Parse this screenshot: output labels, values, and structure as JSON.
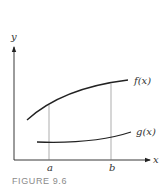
{
  "figure": {
    "caption": "FIGURE 9.6",
    "axes": {
      "x_label": "x",
      "y_label": "y"
    },
    "curves": [
      {
        "name": "f",
        "label": "f(x)"
      },
      {
        "name": "g",
        "label": "g(x)"
      }
    ],
    "markers": [
      {
        "label": "a"
      },
      {
        "label": "b"
      }
    ],
    "colors": {
      "ink": "#222222",
      "guide": "#777777",
      "caption": "#8a8a8a"
    }
  }
}
